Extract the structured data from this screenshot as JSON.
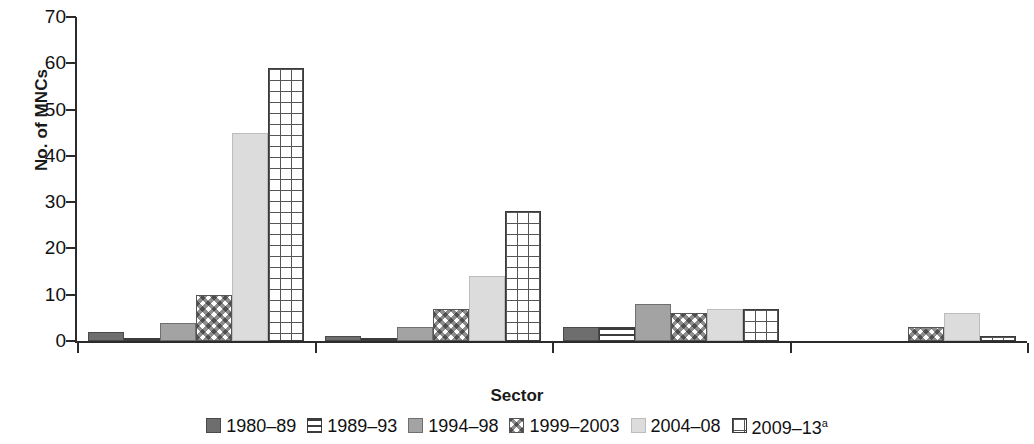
{
  "chart_data": {
    "type": "bar",
    "title": "",
    "xlabel": "Sector",
    "ylabel": "No. of MNCs",
    "ylim": [
      0,
      70
    ],
    "ytick_step": 10,
    "yticks": [
      0,
      10,
      20,
      30,
      40,
      50,
      60,
      70
    ],
    "grid": false,
    "legend_position": "bottom",
    "categories": [
      "Business services",
      "Medical devices",
      "Electrical and electronics",
      "Metalwork and automotive"
    ],
    "series": [
      {
        "name": "1980–89",
        "pattern": "solid-dark",
        "color": "#6e6e6e",
        "values": [
          2,
          1,
          3,
          0
        ]
      },
      {
        "name": "1989–93",
        "pattern": "hlines",
        "color": "#3c3c3c",
        "values": [
          0.5,
          0.5,
          3,
          0
        ]
      },
      {
        "name": "1994–98",
        "pattern": "solid-mid",
        "color": "#a3a3a3",
        "values": [
          4,
          3,
          8,
          0
        ]
      },
      {
        "name": "1999–2003",
        "pattern": "checker",
        "color": "#8d8d8d",
        "values": [
          10,
          7,
          6,
          3
        ]
      },
      {
        "name": "2004–08",
        "pattern": "solid-light",
        "color": "#dcdcdc",
        "values": [
          45,
          14,
          7,
          6
        ]
      },
      {
        "name": "2009–13",
        "pattern": "grid",
        "color": "#555555",
        "values": [
          59,
          28,
          7,
          1
        ],
        "superscript": "a"
      }
    ]
  },
  "axes": {
    "y_title": "No. of MNCs",
    "x_title": "Sector",
    "y_tick_labels": [
      "0",
      "10",
      "20",
      "30",
      "40",
      "50",
      "60",
      "70"
    ]
  },
  "categories": [
    {
      "label": "Business services"
    },
    {
      "label": "Medical devices"
    },
    {
      "label": "Electrical and electronics"
    },
    {
      "label": "Metalwork and automotive"
    }
  ],
  "legend": [
    {
      "label": "1980–89",
      "sup": ""
    },
    {
      "label": "1989–93",
      "sup": ""
    },
    {
      "label": "1994–98",
      "sup": ""
    },
    {
      "label": "1999–2003",
      "sup": ""
    },
    {
      "label": "2004–08",
      "sup": ""
    },
    {
      "label": "2009–13",
      "sup": "a"
    }
  ]
}
